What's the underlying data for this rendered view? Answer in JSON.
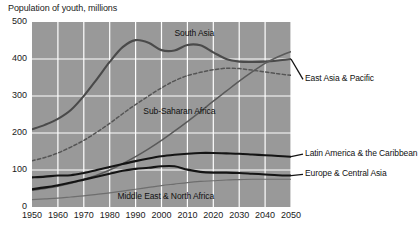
{
  "chart_data": {
    "type": "line",
    "title": "Population of youth, millions",
    "xlabel": "",
    "ylabel": "",
    "xlim": [
      1950,
      2050
    ],
    "ylim": [
      0,
      500
    ],
    "grid": true,
    "legend_position": "inline-annotations",
    "x_ticks": [
      "1950",
      "1960",
      "1970",
      "1980",
      "1990",
      "2000",
      "2010",
      "2020",
      "2030",
      "2040",
      "2050"
    ],
    "y_ticks": [
      "0",
      "100",
      "200",
      "300",
      "400",
      "500"
    ],
    "x": [
      1950,
      1955,
      1960,
      1965,
      1970,
      1975,
      1980,
      1985,
      1990,
      1995,
      2000,
      2005,
      2010,
      2015,
      2020,
      2025,
      2030,
      2035,
      2040,
      2045,
      2050
    ],
    "series": [
      {
        "name": "East Asia & Pacific",
        "style": "solid",
        "color": "#4a4a4a",
        "width": 2.1,
        "label_x": 2052,
        "label_y": 345,
        "values": [
          210,
          222,
          238,
          262,
          300,
          345,
          392,
          432,
          451,
          444,
          424,
          423,
          438,
          437,
          418,
          400,
          393,
          392,
          393,
          396,
          400
        ]
      },
      {
        "name": "South Asia",
        "style": "dashed",
        "color": "#555555",
        "width": 1.5,
        "label_x": 2005,
        "label_y": 468,
        "values": [
          125,
          134,
          146,
          162,
          180,
          202,
          226,
          252,
          277,
          300,
          322,
          341,
          355,
          364,
          371,
          375,
          374,
          370,
          365,
          360,
          356
        ]
      },
      {
        "name": "Sub-Saharan Africa",
        "style": "solid",
        "color": "#5a5a5a",
        "width": 1.5,
        "label_x": 1993,
        "label_y": 258,
        "values": [
          45,
          50,
          56,
          64,
          74,
          86,
          100,
          117,
          136,
          157,
          180,
          205,
          231,
          258,
          286,
          313,
          340,
          365,
          388,
          406,
          420
        ]
      },
      {
        "name": "Latin America & the Caribbean",
        "style": "solid",
        "color": "#141414",
        "width": 2.1,
        "label_x": 2052,
        "label_y": 143,
        "values": [
          80,
          82,
          85,
          86,
          92,
          100,
          108,
          116,
          124,
          131,
          137,
          141,
          144,
          146,
          146,
          145,
          144,
          142,
          140,
          138,
          136
        ]
      },
      {
        "name": "Europe & Central Asia",
        "style": "solid",
        "color": "#141414",
        "width": 2.1,
        "label_x": 2052,
        "label_y": 88,
        "values": [
          48,
          53,
          59,
          66,
          74,
          82,
          90,
          98,
          103,
          106,
          110,
          110,
          101,
          95,
          93,
          93,
          92,
          90,
          88,
          86,
          85
        ]
      },
      {
        "name": "Middle East & North Africa",
        "style": "solid",
        "color": "#6e6e6e",
        "width": 1.2,
        "label_x": 1983,
        "label_y": 28,
        "values": [
          20,
          22,
          24,
          27,
          30,
          34,
          38,
          43,
          48,
          53,
          58,
          62,
          66,
          69,
          71,
          73,
          74,
          75,
          75,
          75,
          75
        ]
      }
    ]
  },
  "colors": {
    "plot_background": "#999999",
    "gridline": "#ffffff",
    "text": "#1a1a1a"
  }
}
